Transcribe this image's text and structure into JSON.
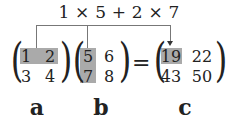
{
  "formula": "1 × 5 + 2 × 7",
  "matrices": {
    "a": {
      "label": "a",
      "rows": [
        [
          "1",
          "2"
        ],
        [
          "3",
          "4"
        ]
      ],
      "highlight": "row 1"
    },
    "b": {
      "label": "b",
      "rows": [
        [
          "5",
          "6"
        ],
        [
          "7",
          "8"
        ]
      ],
      "highlight": "column 1"
    },
    "c": {
      "label": "c",
      "rows": [
        [
          "19",
          "22"
        ],
        [
          "43",
          "50"
        ]
      ],
      "highlight": "cell (1,1)"
    }
  },
  "equals": "=",
  "colors": {
    "highlight": "#aaaaaa",
    "line": "#777777",
    "text": "#222222"
  }
}
